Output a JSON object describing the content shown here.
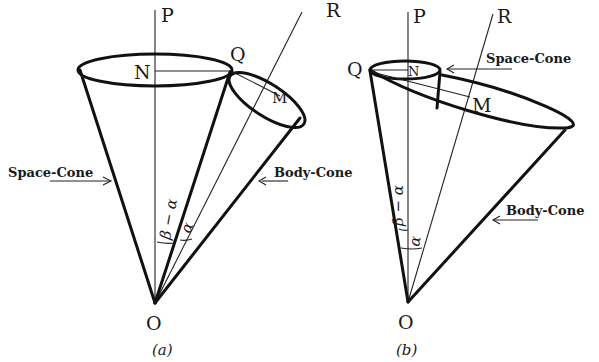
{
  "figure": {
    "panels": [
      {
        "id": "a",
        "caption": "(a)",
        "points": {
          "P": "P",
          "R": "R",
          "Q": "Q",
          "N": "N",
          "M": "M",
          "O": "O"
        },
        "cone_labels": {
          "space": "Space-Cone",
          "body": "Body-Cone"
        },
        "angle_labels": {
          "left": "β − α",
          "right": "α"
        }
      },
      {
        "id": "b",
        "caption": "(b)",
        "points": {
          "P": "P",
          "R": "R",
          "Q": "Q",
          "N": "N",
          "M": "M",
          "O": "O"
        },
        "cone_labels": {
          "space": "Space-Cone",
          "body": "Body-Cone"
        },
        "angle_labels": {
          "left": "β − α",
          "right": "α"
        }
      }
    ],
    "colors": {
      "ink": "#111111",
      "background": "#ffffff"
    }
  }
}
